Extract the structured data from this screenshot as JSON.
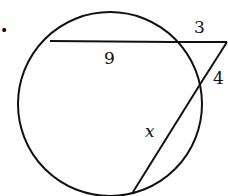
{
  "figure": {
    "stroke_color": "#111111",
    "background": "#ffffff",
    "bullet": "•",
    "circle": {
      "cx": 110,
      "cy": 104,
      "r": 92
    },
    "segments": {
      "chord": {
        "x1": 50,
        "y1": 41,
        "x2": 173,
        "y2": 42
      },
      "external_top": {
        "x1": 173,
        "y1": 42,
        "x2": 228,
        "y2": 42
      },
      "external_right": {
        "x1": 228,
        "y1": 42,
        "x2": 199,
        "y2": 86
      },
      "secant_inside": {
        "x1": 199,
        "y1": 86,
        "x2": 133,
        "y2": 191
      }
    },
    "labels": {
      "chord_length": "9",
      "external_top_length": "3",
      "external_right_length": "4",
      "unknown": "x"
    }
  }
}
